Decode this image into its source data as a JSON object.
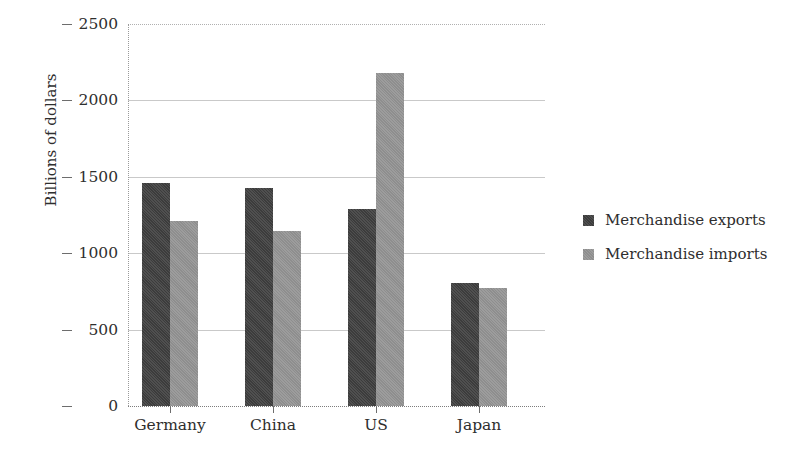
{
  "chart_data": {
    "type": "bar",
    "title": "",
    "subtitle": "",
    "xlabel": "",
    "ylabel": "Billions of dollars",
    "categories": [
      "Germany",
      "China",
      "US",
      "Japan"
    ],
    "series": [
      {
        "name": "Merchandise exports",
        "color": "#3c3c3c",
        "values": [
          1460,
          1430,
          1290,
          805
        ]
      },
      {
        "name": "Merchandise imports",
        "color": "#8e8e8e",
        "values": [
          1210,
          1145,
          2180,
          775
        ]
      }
    ],
    "ylim": [
      0,
      2500
    ],
    "yticks": [
      0,
      500,
      1000,
      1500,
      2000,
      2500
    ],
    "ytick_labels": [
      "0",
      "500",
      "1000",
      "1500",
      "2000",
      "2500"
    ],
    "grid": true,
    "grid_axis": "y",
    "legend_position": "right",
    "annotations": []
  },
  "legend": {
    "entries": [
      {
        "label": "Merchandise exports",
        "swatch": "legend-swatch-exports"
      },
      {
        "label": "Merchandise imports",
        "swatch": "legend-swatch-imports"
      }
    ]
  }
}
